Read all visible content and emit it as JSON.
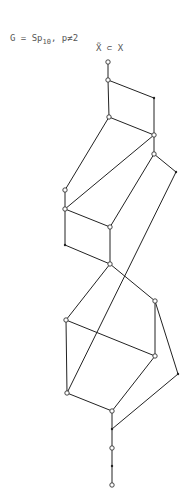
{
  "title": {
    "prefix": "G = Sp",
    "subscript": "10",
    "suffix": ", p≠2"
  },
  "relation": "X̃ ⊂ X",
  "diagram": {
    "type": "Hasse diagram / poset lattice",
    "vertices": [
      {
        "id": "v1",
        "style": "open"
      },
      {
        "id": "v2",
        "style": "open"
      },
      {
        "id": "v3",
        "style": "dot"
      },
      {
        "id": "v4",
        "style": "open"
      },
      {
        "id": "v5",
        "style": "open"
      },
      {
        "id": "v6",
        "style": "open"
      },
      {
        "id": "v7",
        "style": "dot"
      },
      {
        "id": "v8",
        "style": "open"
      },
      {
        "id": "v9",
        "style": "open"
      },
      {
        "id": "v10",
        "style": "open"
      },
      {
        "id": "v11",
        "style": "dot"
      },
      {
        "id": "v12",
        "style": "open"
      },
      {
        "id": "v13",
        "style": "open"
      },
      {
        "id": "v14",
        "style": "open"
      },
      {
        "id": "v15",
        "style": "open"
      },
      {
        "id": "v16",
        "style": "open"
      },
      {
        "id": "v17",
        "style": "dot"
      },
      {
        "id": "v18",
        "style": "open"
      },
      {
        "id": "v19",
        "style": "dot"
      },
      {
        "id": "v20",
        "style": "open"
      },
      {
        "id": "v21",
        "style": "dot"
      },
      {
        "id": "v22",
        "style": "open"
      }
    ],
    "edges": [
      [
        "v1",
        "v2"
      ],
      [
        "v2",
        "v3"
      ],
      [
        "v2",
        "v4"
      ],
      [
        "v3",
        "v5"
      ],
      [
        "v4",
        "v5"
      ],
      [
        "v4",
        "v8"
      ],
      [
        "v5",
        "v9"
      ],
      [
        "v5",
        "v6"
      ],
      [
        "v6",
        "v7"
      ],
      [
        "v6",
        "v10"
      ],
      [
        "v8",
        "v9"
      ],
      [
        "v9",
        "v10"
      ],
      [
        "v9",
        "v11"
      ],
      [
        "v10",
        "v12"
      ],
      [
        "v11",
        "v12"
      ],
      [
        "v7",
        "v16"
      ],
      [
        "v12",
        "v13"
      ],
      [
        "v12",
        "v14"
      ],
      [
        "v13",
        "v15"
      ],
      [
        "v13",
        "v16"
      ],
      [
        "v14",
        "v15"
      ],
      [
        "v14",
        "v17"
      ],
      [
        "v15",
        "v18"
      ],
      [
        "v16",
        "v18"
      ],
      [
        "v17",
        "v19"
      ],
      [
        "v18",
        "v19"
      ],
      [
        "v19",
        "v20"
      ],
      [
        "v20",
        "v21"
      ],
      [
        "v21",
        "v22"
      ]
    ]
  }
}
